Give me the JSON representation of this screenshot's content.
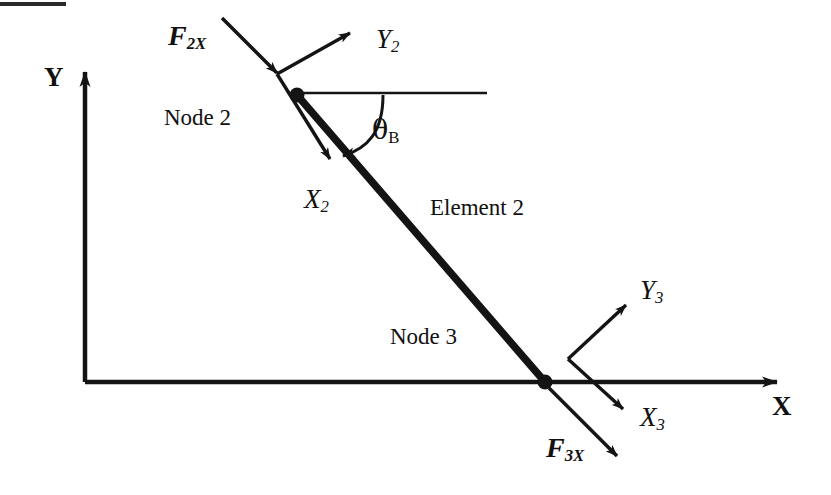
{
  "figure": {
    "width": 831,
    "height": 495,
    "background": "#ffffff",
    "ink_color": "#141414"
  },
  "top_rule": {
    "name": "page-crop-rule",
    "x": 0,
    "y": 2,
    "width": 66,
    "height": 4,
    "color": "#2a2a2a"
  },
  "global_axes": {
    "origin": {
      "x": 85,
      "y": 382
    },
    "x_axis": {
      "label": "X",
      "label_x": 772,
      "label_y": 393,
      "from": {
        "x": 85,
        "y": 382
      },
      "to": {
        "x": 788,
        "y": 382
      }
    },
    "y_axis": {
      "label": "Y",
      "label_x": 44,
      "label_y": 64,
      "from": {
        "x": 85,
        "y": 382
      },
      "to": {
        "x": 85,
        "y": 64
      }
    }
  },
  "element": {
    "label": "Element 2",
    "label_x": 430,
    "label_y": 196,
    "from": {
      "x": 297,
      "y": 95
    },
    "to": {
      "x": 545,
      "y": 382
    },
    "stroke_width": 7
  },
  "nodes": [
    {
      "id": "node-2",
      "label": "Node 2",
      "label_x": 164,
      "label_y": 106,
      "dot": {
        "x": 297,
        "y": 95,
        "r": 7
      }
    },
    {
      "id": "node-3",
      "label": "Node 3",
      "label_x": 390,
      "label_y": 325,
      "dot": {
        "x": 545,
        "y": 382,
        "r": 7
      }
    }
  ],
  "angle": {
    "name": "theta-B",
    "symbol": "θ",
    "subscript": "B",
    "label_x": 372,
    "label_y": 116,
    "reference_line": {
      "from": {
        "x": 297,
        "y": 93
      },
      "to": {
        "x": 487,
        "y": 93
      }
    },
    "arc_sweep": "clockwise from horizontal reference down to element axis"
  },
  "local_frames": [
    {
      "id": "node-2-frame",
      "vertex": {
        "x": 277,
        "y": 74
      },
      "axes": [
        {
          "name": "Y2",
          "symbol": "Y",
          "subscript": "2",
          "label_x": 376,
          "label_y": 26,
          "from": {
            "x": 277,
            "y": 74
          },
          "to": {
            "x": 356,
            "y": 30
          }
        },
        {
          "name": "X2",
          "symbol": "X",
          "subscript": "2",
          "label_x": 304,
          "label_y": 186,
          "from": {
            "x": 277,
            "y": 74
          },
          "to": {
            "x": 334,
            "y": 166
          }
        }
      ]
    },
    {
      "id": "node-3-frame",
      "vertex": {
        "x": 568,
        "y": 359
      },
      "axes": [
        {
          "name": "Y3",
          "symbol": "Y",
          "subscript": "3",
          "label_x": 640,
          "label_y": 277,
          "from": {
            "x": 568,
            "y": 359
          },
          "to": {
            "x": 630,
            "y": 300
          }
        },
        {
          "name": "X3",
          "symbol": "X",
          "subscript": "3",
          "label_x": 640,
          "label_y": 404,
          "from": {
            "x": 568,
            "y": 359
          },
          "to": {
            "x": 628,
            "y": 414
          }
        }
      ]
    }
  ],
  "forces": [
    {
      "name": "F2X",
      "symbol": "F",
      "subscript": "2X",
      "label_x": 168,
      "label_y": 22,
      "from": {
        "x": 222,
        "y": 18
      },
      "to": {
        "x": 281,
        "y": 77
      }
    },
    {
      "name": "F3X",
      "symbol": "F",
      "subscript": "3X",
      "label_x": 546,
      "label_y": 434,
      "from": {
        "x": 549,
        "y": 388
      },
      "to": {
        "x": 622,
        "y": 461
      }
    }
  ]
}
